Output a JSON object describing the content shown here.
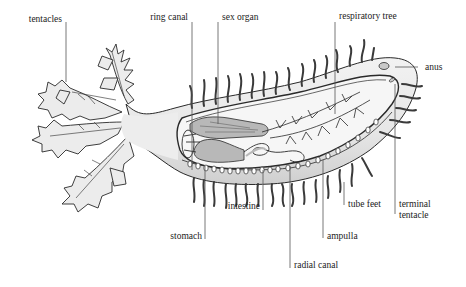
{
  "diagram": {
    "colors": {
      "outline": "#2a2a2a",
      "body_fill": "#e9e9e9",
      "organ_fill": "#b8b8b8",
      "inner_fill": "#f4f4f4",
      "leader_line": "#555555",
      "text": "#222222"
    },
    "labels": {
      "tentacles": "tentacles",
      "ring_canal": "ring canal",
      "sex_organ": "sex organ",
      "respiratory_tree": "respiratory tree",
      "anus": "anus",
      "terminal_tentacle_line1": "terminal",
      "terminal_tentacle_line2": "tentacle",
      "tube_feet": "tube feet",
      "ampulla": "ampulla",
      "intestine": "intestine",
      "stomach": "stomach",
      "radial_canal": "radial canal"
    }
  }
}
